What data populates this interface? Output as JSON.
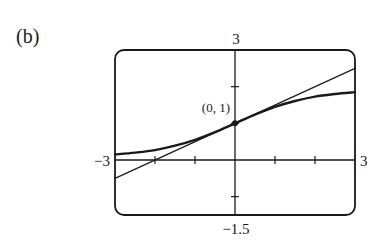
{
  "figure": {
    "part_label": "(b)",
    "point_label": "(0, 1)"
  },
  "chart_data": {
    "type": "line",
    "title": "",
    "xlabel": "",
    "ylabel": "",
    "xlim": [
      -3,
      3
    ],
    "ylim": [
      -1.5,
      3
    ],
    "grid": false,
    "legend": null,
    "tick_labels": {
      "x_min": "−3",
      "x_max": "3",
      "y_min": "−1.5",
      "y_max": "3"
    },
    "x_ticks": [
      -2,
      -1,
      1,
      2
    ],
    "y_ticks": [
      -1,
      1,
      2
    ],
    "annotations": [
      {
        "text": "(0, 1)",
        "x": 0,
        "y": 1,
        "marker": "dot"
      }
    ],
    "series": [
      {
        "name": "curve",
        "style": "thick",
        "x": [
          -3,
          -2.5,
          -2,
          -1.5,
          -1,
          -0.5,
          0,
          0.5,
          1,
          1.5,
          2,
          2.5,
          3
        ],
        "y": [
          0.15,
          0.2,
          0.27,
          0.39,
          0.55,
          0.76,
          1.0,
          1.24,
          1.45,
          1.61,
          1.73,
          1.8,
          1.85
        ]
      },
      {
        "name": "tangent line at (0,1)",
        "style": "thin",
        "x": [
          -3,
          3
        ],
        "y": [
          -0.5,
          2.5
        ]
      }
    ]
  }
}
